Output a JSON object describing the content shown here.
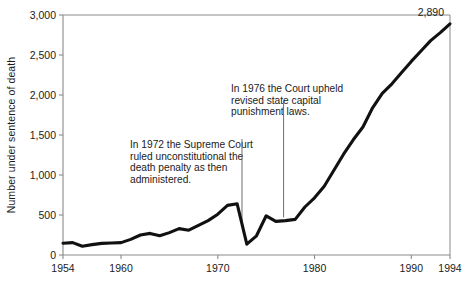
{
  "chart_data": {
    "type": "line",
    "title": "",
    "subtitle": "",
    "xlabel": "",
    "ylabel": "Number under sentence of death",
    "xlim": [
      1954,
      1994
    ],
    "ylim": [
      0,
      3000
    ],
    "grid": false,
    "legend": "none",
    "x_ticks": [
      "1954",
      "1960",
      "1970",
      "1980",
      "1990",
      "1994"
    ],
    "x_tick_values": [
      1954,
      1960,
      1970,
      1980,
      1990,
      1994
    ],
    "y_ticks": [
      "0",
      "500",
      "1,000",
      "1,500",
      "2,000",
      "2,500",
      "3,000"
    ],
    "y_tick_values": [
      0,
      500,
      1000,
      1500,
      2000,
      2500,
      3000
    ],
    "x": [
      1954,
      1955,
      1956,
      1957,
      1958,
      1959,
      1960,
      1961,
      1962,
      1963,
      1964,
      1965,
      1966,
      1967,
      1968,
      1969,
      1970,
      1971,
      1972,
      1973,
      1974,
      1975,
      1976,
      1977,
      1978,
      1979,
      1980,
      1981,
      1982,
      1983,
      1984,
      1985,
      1986,
      1987,
      1988,
      1989,
      1990,
      1991,
      1992,
      1993,
      1994
    ],
    "values": [
      147,
      155,
      110,
      130,
      145,
      150,
      155,
      195,
      250,
      270,
      240,
      280,
      330,
      310,
      370,
      430,
      510,
      620,
      640,
      135,
      240,
      490,
      420,
      430,
      445,
      600,
      715,
      860,
      1060,
      1260,
      1440,
      1600,
      1840,
      2020,
      2140,
      2280,
      2420,
      2550,
      2680,
      2780,
      2890
    ],
    "series": [
      {
        "name": "Number under sentence of death",
        "values": [
          147,
          155,
          110,
          130,
          145,
          150,
          155,
          195,
          250,
          270,
          240,
          280,
          330,
          310,
          370,
          430,
          510,
          620,
          640,
          135,
          240,
          490,
          420,
          430,
          445,
          600,
          715,
          860,
          1060,
          1260,
          1440,
          1600,
          1840,
          2020,
          2140,
          2280,
          2420,
          2550,
          2680,
          2780,
          2890
        ]
      }
    ],
    "data_labels": [
      {
        "text": "2,890",
        "x": 1994,
        "y": 2890
      }
    ],
    "annotations": [
      {
        "id": "annotation-1972",
        "lines": [
          "In 1972 the Supreme Court",
          "ruled unconstitutional the",
          "death penalty as then",
          "administered."
        ],
        "leader_x": 1972.5,
        "leader_y_top": 1450,
        "leader_y_bottom": 390
      },
      {
        "id": "annotation-1976",
        "lines": [
          "In 1976 the Court upheld",
          "revised state capital",
          "punishment laws."
        ],
        "leader_x": 1976.8,
        "leader_y_top": 1930,
        "leader_y_bottom": 470
      }
    ],
    "colors": {
      "line": "#111111",
      "axis": "#8a8a8a",
      "text": "#1b1b1b",
      "background": "#ffffff"
    }
  }
}
